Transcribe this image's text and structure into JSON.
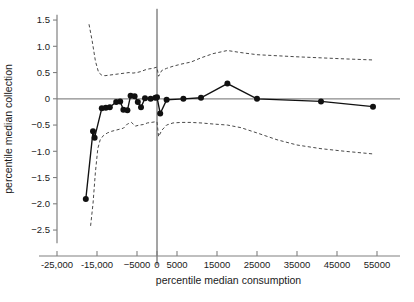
{
  "chart_data": {
    "type": "line",
    "title": "",
    "xlabel": "percentile median consumption",
    "ylabel": "percentile median collection",
    "xlim": [
      -27500,
      58000
    ],
    "ylim": [
      -2.75,
      1.6
    ],
    "grid": false,
    "legend": "none",
    "xticks": [
      -25000,
      -15000,
      -5000,
      0,
      5000,
      15000,
      25000,
      35000,
      45000,
      55000
    ],
    "xticklabels": [
      "-25,000",
      "-15,000",
      "−5000",
      "0",
      "5000",
      "15000",
      "25000",
      "35000",
      "45000",
      "55000"
    ],
    "yticks": [
      1.5,
      1.0,
      0.5,
      0,
      -0.5,
      -1.0,
      -1.5,
      -2.0,
      -2.5
    ],
    "yticklabels": [
      "1.5",
      "1.0",
      "0.5",
      "0",
      "−0.5",
      "−1.0",
      "−1.5",
      "−2.0",
      "−2.5"
    ],
    "reference_lines": [
      {
        "name": "horizontal-zero-line",
        "orientation": "horizontal",
        "value": 0
      },
      {
        "name": "vertical-zero-line",
        "orientation": "vertical",
        "value": 0
      }
    ],
    "series": [
      {
        "name": "estimate",
        "style": "solid-with-markers",
        "color": "#111111",
        "x": [
          -17800,
          -16000,
          -15600,
          -13800,
          -12800,
          -11800,
          -10200,
          -9200,
          -8400,
          -7400,
          -6600,
          -5600,
          -4800,
          -4000,
          -3000,
          -1600,
          -400,
          0,
          800,
          2400,
          6600,
          11000,
          17600,
          25000,
          41000,
          54000
        ],
        "y": [
          -1.91,
          -0.62,
          -0.74,
          -0.18,
          -0.17,
          -0.16,
          -0.06,
          -0.05,
          -0.21,
          -0.22,
          0.06,
          0.05,
          -0.06,
          -0.16,
          0.01,
          0.0,
          0.02,
          0.03,
          -0.28,
          -0.02,
          0.0,
          0.02,
          0.29,
          0.0,
          -0.05,
          -0.15
        ]
      },
      {
        "name": "upper-confidence-band",
        "style": "dashed",
        "color": "#4a4a4a",
        "x": [
          -17000,
          -16200,
          -15400,
          -14600,
          -13800,
          -13000,
          -12000,
          -11000,
          -10000,
          -9000,
          -8000,
          -7000,
          -6000,
          -5000,
          -4000,
          -3000,
          -2000,
          -1000,
          -200,
          0,
          400,
          1200,
          2400,
          4000,
          6000,
          8500,
          11000,
          14000,
          17600,
          21000,
          25000,
          30000,
          35000,
          41000,
          47000,
          54000
        ],
        "y": [
          1.42,
          1.1,
          0.72,
          0.5,
          0.45,
          0.44,
          0.45,
          0.46,
          0.47,
          0.48,
          0.49,
          0.5,
          0.49,
          0.5,
          0.52,
          0.55,
          0.57,
          0.58,
          0.6,
          0.6,
          0.43,
          0.54,
          0.58,
          0.62,
          0.66,
          0.7,
          0.78,
          0.86,
          0.92,
          0.88,
          0.84,
          0.82,
          0.8,
          0.78,
          0.76,
          0.74
        ]
      },
      {
        "name": "lower-confidence-band",
        "style": "dashed",
        "color": "#4a4a4a",
        "x": [
          -16600,
          -16000,
          -15400,
          -14800,
          -14200,
          -13400,
          -12400,
          -11400,
          -10400,
          -9400,
          -8400,
          -7400,
          -6400,
          -5400,
          -4400,
          -3400,
          -2400,
          -1400,
          -600,
          0,
          400,
          1200,
          2400,
          4000,
          6000,
          8500,
          11000,
          14000,
          17600,
          21000,
          25000,
          30000,
          35000,
          41000,
          47000,
          54000
        ],
        "y": [
          -2.42,
          -2.0,
          -1.4,
          -0.95,
          -0.78,
          -0.7,
          -0.65,
          -0.62,
          -0.6,
          -0.58,
          -0.56,
          -0.48,
          -0.45,
          -0.52,
          -0.5,
          -0.49,
          -0.46,
          -0.45,
          -0.44,
          -0.44,
          -0.72,
          -0.6,
          -0.5,
          -0.46,
          -0.45,
          -0.45,
          -0.46,
          -0.48,
          -0.5,
          -0.55,
          -0.65,
          -0.78,
          -0.88,
          -0.95,
          -1.0,
          -1.05
        ]
      }
    ],
    "markers": {
      "shape": "circle",
      "radius_px": 3.0,
      "color": "#111111"
    }
  }
}
